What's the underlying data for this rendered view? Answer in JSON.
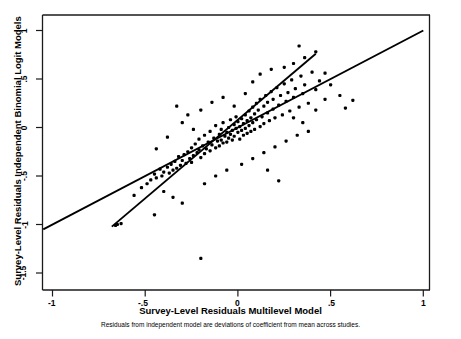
{
  "axes": {
    "ylabel": "Survey-Level Residuals Independent Binomial Logit Models",
    "xlabel": "Survey-Level Residuals Multilevel Model",
    "note": "Residuals from independent model are deviations of coefficient from mean across studies.",
    "xticklabels": [
      "-1",
      "-.5",
      "0",
      ".5",
      "1"
    ],
    "yticklabels": [
      "1",
      ".5",
      "0",
      "-.5",
      "-1",
      "-1.5"
    ]
  },
  "chart_data": {
    "type": "scatter",
    "title": "",
    "subtitle": "Residuals from independent model are deviations of coefficient from mean across studies.",
    "xlabel": "Survey-Level Residuals Multilevel Model",
    "ylabel": "Survey-Level Residuals Independent Binomial Logit Models",
    "xlim": [
      -1.15,
      1.09
    ],
    "ylim": [
      -1.62,
      1.12
    ],
    "xticks": [
      -1,
      -0.5,
      0,
      0.5,
      1
    ],
    "yticks": [
      1,
      0.5,
      0,
      -0.5,
      -1,
      -1.5
    ],
    "grid": false,
    "legend": false,
    "marker_color": "#000000",
    "line_color": "#000000",
    "series": [
      {
        "name": "Survey-level residuals",
        "type": "scatter",
        "points": [
          [
            -0.66,
            -1.01
          ],
          [
            -0.65,
            -1.0
          ],
          [
            -0.63,
            -0.99
          ],
          [
            -0.56,
            -0.7
          ],
          [
            -0.52,
            -0.62
          ],
          [
            -0.49,
            -0.58
          ],
          [
            -0.47,
            -0.54
          ],
          [
            -0.45,
            -0.48
          ],
          [
            -0.44,
            -0.52
          ],
          [
            -0.42,
            -0.43
          ],
          [
            -0.41,
            -0.5
          ],
          [
            -0.4,
            -0.46
          ],
          [
            -0.38,
            -0.41
          ],
          [
            -0.37,
            -0.47
          ],
          [
            -0.36,
            -0.38
          ],
          [
            -0.35,
            -0.44
          ],
          [
            -0.34,
            -0.35
          ],
          [
            -0.33,
            -0.42
          ],
          [
            -0.32,
            -0.3
          ],
          [
            -0.31,
            -0.39
          ],
          [
            -0.3,
            -0.34
          ],
          [
            -0.29,
            -0.28
          ],
          [
            -0.28,
            -0.37
          ],
          [
            -0.27,
            -0.25
          ],
          [
            -0.26,
            -0.32
          ],
          [
            -0.25,
            -0.21
          ],
          [
            -0.25,
            -0.36
          ],
          [
            -0.24,
            -0.29
          ],
          [
            -0.23,
            -0.17
          ],
          [
            -0.22,
            -0.26
          ],
          [
            -0.21,
            -0.23
          ],
          [
            -0.21,
            -0.12
          ],
          [
            -0.2,
            -0.31
          ],
          [
            -0.19,
            -0.19
          ],
          [
            -0.18,
            -0.27
          ],
          [
            -0.18,
            -0.08
          ],
          [
            -0.17,
            -0.22
          ],
          [
            -0.16,
            -0.15
          ],
          [
            -0.15,
            -0.24
          ],
          [
            -0.15,
            -0.04
          ],
          [
            -0.14,
            -0.18
          ],
          [
            -0.13,
            -0.11
          ],
          [
            -0.12,
            -0.21
          ],
          [
            -0.12,
            0.02
          ],
          [
            -0.11,
            -0.14
          ],
          [
            -0.1,
            -0.07
          ],
          [
            -0.1,
            -0.19
          ],
          [
            -0.09,
            -0.02
          ],
          [
            -0.09,
            -0.13
          ],
          [
            -0.08,
            -0.16
          ],
          [
            -0.08,
            0.05
          ],
          [
            -0.07,
            -0.09
          ],
          [
            -0.06,
            -0.05
          ],
          [
            -0.06,
            -0.15
          ],
          [
            -0.05,
            0.0
          ],
          [
            -0.05,
            -0.11
          ],
          [
            -0.04,
            -0.07
          ],
          [
            -0.04,
            0.08
          ],
          [
            -0.03,
            -0.03
          ],
          [
            -0.03,
            -0.13
          ],
          [
            -0.02,
            0.03
          ],
          [
            -0.02,
            -0.09
          ],
          [
            -0.01,
            -0.01
          ],
          [
            -0.01,
            0.11
          ],
          [
            0.0,
            -0.05
          ],
          [
            0.0,
            0.06
          ],
          [
            0.01,
            0.01
          ],
          [
            0.01,
            -0.12
          ],
          [
            0.02,
            0.09
          ],
          [
            0.02,
            -0.03
          ],
          [
            0.03,
            0.04
          ],
          [
            0.03,
            -0.08
          ],
          [
            0.04,
            0.13
          ],
          [
            0.04,
            -0.01
          ],
          [
            0.05,
            0.07
          ],
          [
            0.05,
            -0.06
          ],
          [
            0.06,
            0.17
          ],
          [
            0.06,
            0.02
          ],
          [
            0.07,
            0.1
          ],
          [
            0.07,
            -0.04
          ],
          [
            0.08,
            0.21
          ],
          [
            0.08,
            0.05
          ],
          [
            0.09,
            0.14
          ],
          [
            0.09,
            -0.02
          ],
          [
            0.1,
            0.25
          ],
          [
            0.1,
            0.08
          ],
          [
            0.11,
            0.18
          ],
          [
            0.12,
            0.01
          ],
          [
            0.12,
            0.29
          ],
          [
            0.13,
            0.11
          ],
          [
            0.14,
            0.22
          ],
          [
            0.14,
            0.04
          ],
          [
            0.15,
            0.33
          ],
          [
            0.16,
            0.15
          ],
          [
            0.16,
            0.26
          ],
          [
            0.17,
            0.07
          ],
          [
            0.18,
            0.37
          ],
          [
            0.19,
            0.19
          ],
          [
            0.19,
            0.29
          ],
          [
            0.2,
            0.1
          ],
          [
            0.21,
            0.41
          ],
          [
            0.22,
            0.23
          ],
          [
            0.23,
            0.33
          ],
          [
            0.24,
            0.13
          ],
          [
            0.25,
            0.45
          ],
          [
            0.26,
            0.27
          ],
          [
            0.27,
            0.36
          ],
          [
            0.28,
            0.17
          ],
          [
            0.29,
            0.49
          ],
          [
            0.3,
            0.31
          ],
          [
            0.31,
            0.4
          ],
          [
            0.33,
            0.21
          ],
          [
            0.34,
            0.53
          ],
          [
            0.35,
            0.35
          ],
          [
            0.36,
            0.44
          ],
          [
            0.38,
            0.25
          ],
          [
            0.4,
            0.57
          ],
          [
            0.42,
            0.39
          ],
          [
            0.44,
            0.48
          ],
          [
            0.47,
            0.29
          ],
          [
            0.25,
            0.62
          ],
          [
            0.3,
            0.66
          ],
          [
            0.36,
            0.72
          ],
          [
            0.42,
            0.78
          ],
          [
            0.33,
            0.84
          ],
          [
            0.47,
            0.56
          ],
          [
            0.12,
            0.55
          ],
          [
            0.18,
            0.6
          ],
          [
            0.08,
            0.47
          ],
          [
            -0.33,
            0.22
          ],
          [
            -0.27,
            0.13
          ],
          [
            -0.2,
            0.18
          ],
          [
            -0.14,
            0.26
          ],
          [
            -0.08,
            0.31
          ],
          [
            -0.02,
            0.22
          ],
          [
            0.04,
            0.35
          ],
          [
            0.55,
            0.33
          ],
          [
            0.62,
            0.28
          ],
          [
            0.5,
            0.44
          ],
          [
            0.58,
            0.2
          ],
          [
            0.42,
            0.18
          ],
          [
            -0.38,
            -0.1
          ],
          [
            -0.3,
            0.05
          ],
          [
            -0.24,
            -0.02
          ],
          [
            -0.44,
            -0.22
          ],
          [
            0.2,
            -0.2
          ],
          [
            0.26,
            -0.14
          ],
          [
            0.14,
            -0.26
          ],
          [
            0.08,
            -0.32
          ],
          [
            0.02,
            -0.38
          ],
          [
            -0.06,
            -0.44
          ],
          [
            0.32,
            -0.08
          ],
          [
            0.38,
            -0.04
          ],
          [
            -0.12,
            -0.5
          ],
          [
            0.22,
            -0.55
          ],
          [
            -0.18,
            -0.58
          ],
          [
            0.16,
            -0.44
          ],
          [
            -0.4,
            -0.66
          ],
          [
            -0.35,
            -0.72
          ],
          [
            -0.3,
            -0.78
          ],
          [
            0.3,
            0.1
          ],
          [
            0.35,
            0.05
          ],
          [
            -0.45,
            -0.9
          ],
          [
            -0.2,
            -1.35
          ]
        ]
      },
      {
        "name": "45-degree reference line",
        "type": "line",
        "slope": 1.0,
        "intercept": 0.0,
        "x_range": [
          -1.05,
          1.0
        ]
      },
      {
        "name": "fitted regression line",
        "type": "line",
        "slope": 1.62,
        "intercept": 0.08,
        "x_range": [
          -0.68,
          0.42
        ]
      }
    ]
  }
}
